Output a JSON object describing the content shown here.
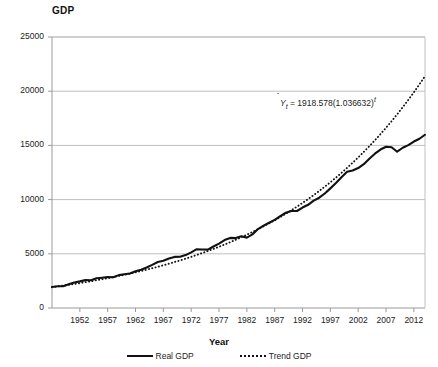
{
  "chart_data": {
    "type": "line",
    "title": "",
    "ylabel": "GDP",
    "xlabel": "Year",
    "ylim": [
      0,
      25000
    ],
    "xlim": [
      1947,
      2014
    ],
    "yticks": [
      "0",
      "5000",
      "10000",
      "15000",
      "20000",
      "25000"
    ],
    "ytick_values": [
      0,
      5000,
      10000,
      15000,
      20000,
      25000
    ],
    "xticks": [
      "1952",
      "1957",
      "1962",
      "1967",
      "1972",
      "1977",
      "1982",
      "1987",
      "1992",
      "1997",
      "2002",
      "2007",
      "2012"
    ],
    "xtick_values": [
      1952,
      1957,
      1962,
      1967,
      1972,
      1977,
      1982,
      1987,
      1992,
      1997,
      2002,
      2007,
      2012
    ],
    "grid": "horizontal",
    "legend_position": "bottom",
    "annotation": "Ŷt = 1918.578(1.036632)^t",
    "annotation_parts": {
      "lhs": "Y",
      "subscript": "t",
      "equals": " = 1918.578(1.036632)",
      "exponent": "t"
    },
    "trend_intercept": 1918.578,
    "trend_growth_rate": 1.036632,
    "x": [
      1947,
      1948,
      1949,
      1950,
      1951,
      1952,
      1953,
      1954,
      1955,
      1956,
      1957,
      1958,
      1959,
      1960,
      1961,
      1962,
      1963,
      1964,
      1965,
      1966,
      1967,
      1968,
      1969,
      1970,
      1971,
      1972,
      1973,
      1974,
      1975,
      1976,
      1977,
      1978,
      1979,
      1980,
      1981,
      1982,
      1983,
      1984,
      1985,
      1986,
      1987,
      1988,
      1989,
      1990,
      1991,
      1992,
      1993,
      1994,
      1995,
      1996,
      1997,
      1998,
      1999,
      2000,
      2001,
      2002,
      2003,
      2004,
      2005,
      2006,
      2007,
      2008,
      2009,
      2010,
      2011,
      2012,
      2013,
      2014
    ],
    "series": [
      {
        "name": "Real GDP",
        "style": "solid",
        "color": "#111111",
        "values": [
          1932,
          2013,
          2008,
          2184,
          2360,
          2456,
          2571,
          2556,
          2739,
          2797,
          2856,
          2835,
          3031,
          3108,
          3188,
          3384,
          3531,
          3735,
          3977,
          4238,
          4356,
          4568,
          4712,
          4722,
          4878,
          5134,
          5424,
          5396,
          5385,
          5675,
          5937,
          6267,
          6466,
          6450,
          6617,
          6491,
          6792,
          7285,
          7594,
          7861,
          8133,
          8475,
          8786,
          8955,
          8948,
          9267,
          9521,
          9906,
          10175,
          10561,
          11035,
          11526,
          12066,
          12560,
          12682,
          12909,
          13271,
          13774,
          14235,
          14616,
          14874,
          14830,
          14419,
          14784,
          15021,
          15355,
          15612,
          15982
        ]
      },
      {
        "name": "Trend GDP",
        "style": "dotted",
        "color": "#111111",
        "values": [
          1919,
          1989,
          2062,
          2138,
          2216,
          2297,
          2381,
          2469,
          2559,
          2653,
          2750,
          2851,
          2956,
          3064,
          3176,
          3293,
          3413,
          3538,
          3668,
          3802,
          3942,
          4086,
          4236,
          4391,
          4552,
          4719,
          4892,
          5071,
          5257,
          5450,
          5649,
          5856,
          6071,
          6293,
          6524,
          6763,
          7011,
          7268,
          7534,
          7810,
          8096,
          8393,
          8700,
          9019,
          9349,
          9692,
          10047,
          10415,
          10796,
          11192,
          11602,
          12027,
          12468,
          12925,
          13398,
          13889,
          14398,
          14925,
          15472,
          16038,
          16626,
          17235,
          17866,
          18520,
          19199,
          19902,
          20631,
          21387
        ]
      }
    ]
  }
}
